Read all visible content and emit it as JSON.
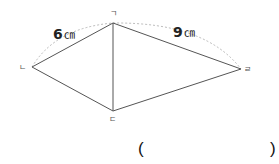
{
  "diagram": {
    "vertices": {
      "giyeok": {
        "label": "ㄱ",
        "x": 113,
        "y": 23
      },
      "nieun": {
        "label": "ㄴ",
        "x": 32,
        "y": 67
      },
      "digeut": {
        "label": "ㄷ",
        "x": 113,
        "y": 111
      },
      "rieul": {
        "label": "ㄹ",
        "x": 241,
        "y": 69
      }
    },
    "measurements": [
      {
        "value": "6",
        "unit": "㎝",
        "between": [
          "ㄴ",
          "ㄱ"
        ]
      },
      {
        "value": "9",
        "unit": "㎝",
        "between": [
          "ㄱ",
          "ㄹ"
        ]
      }
    ],
    "colors": {
      "line": "#555555",
      "arc": "#aaaaaa"
    }
  },
  "answer": {
    "open_paren": "(",
    "close_paren": ")",
    "value": ""
  }
}
